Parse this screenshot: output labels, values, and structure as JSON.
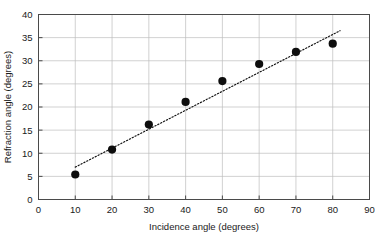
{
  "chart_data": {
    "type": "scatter",
    "title": "",
    "xlabel": "Incidence angle (degrees)",
    "ylabel": "Refraction angle (degrees)",
    "xlim": [
      0,
      90
    ],
    "ylim": [
      0,
      40
    ],
    "xticks": [
      0,
      10,
      20,
      30,
      40,
      50,
      60,
      70,
      80,
      90
    ],
    "yticks": [
      0,
      5,
      10,
      15,
      20,
      25,
      30,
      35,
      40
    ],
    "xtick_labels": [
      "0",
      "10",
      "20",
      "30",
      "40",
      "50",
      "60",
      "70",
      "80",
      "90"
    ],
    "ytick_labels": [
      "0",
      "5",
      "10",
      "15",
      "20",
      "25",
      "30",
      "35",
      "40"
    ],
    "grid": true,
    "legend": false,
    "x": [
      10,
      20,
      30,
      40,
      50,
      60,
      70,
      80
    ],
    "values": [
      5.4,
      10.8,
      16.2,
      21.1,
      25.6,
      29.3,
      31.9,
      33.7
    ],
    "series": [
      {
        "name": "Measured refraction angle",
        "marker": "filled-circle",
        "color": "#0d0d0d",
        "points": [
          {
            "x": 10,
            "y": 5.4
          },
          {
            "x": 20,
            "y": 10.8
          },
          {
            "x": 30,
            "y": 16.2
          },
          {
            "x": 40,
            "y": 21.1
          },
          {
            "x": 50,
            "y": 25.6
          },
          {
            "x": 60,
            "y": 29.3
          },
          {
            "x": 70,
            "y": 31.9
          },
          {
            "x": 80,
            "y": 33.7
          }
        ]
      }
    ],
    "trendline": {
      "style": "dotted",
      "color": "#111111",
      "x_start": 10,
      "y_start": 7.0,
      "x_end": 82,
      "y_end": 36.5
    }
  },
  "colors": {
    "background": "#ffffff",
    "grid": "#bdbdbd",
    "frame": "#4a4a4a",
    "marker": "#0d0d0d",
    "text": "#1a1a1a"
  }
}
